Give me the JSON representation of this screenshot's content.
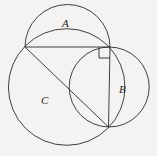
{
  "figure": {
    "background_color": "#f4f3f1",
    "stroke_color": "#2b2b2b",
    "stroke_width": 0.9,
    "width": 157,
    "height": 156,
    "labels": {
      "a": "A",
      "b": "B",
      "c": "C"
    },
    "label_positions": {
      "a": {
        "x": 67,
        "y": 24
      },
      "b": {
        "x": 123,
        "y": 90
      },
      "c": {
        "x": 45,
        "y": 101
      }
    },
    "triangle": {
      "name": "right-triangle",
      "vertices": {
        "left": {
          "x": 25,
          "y": 47
        },
        "corner": {
          "x": 110,
          "y": 47
        },
        "bottom": {
          "x": 108.5,
          "y": 127
        }
      },
      "right_angle_at": "corner",
      "right_angle_marker_size": 11
    },
    "circles": [
      {
        "id": "circle-A",
        "label": "A",
        "note": "semicircle on the horizontal leg",
        "cx": 67.5,
        "cy": 47,
        "r": 42.5,
        "arc": "upper-half"
      },
      {
        "id": "circle-B",
        "label": "B",
        "note": "circle on the vertical leg",
        "cx": 109.2,
        "cy": 87,
        "r": 40,
        "arc": "full"
      },
      {
        "id": "circle-C",
        "label": "C",
        "note": "circle on the hypotenuse",
        "cx": 66.7,
        "cy": 87,
        "r": 58.3,
        "arc": "full"
      }
    ]
  }
}
